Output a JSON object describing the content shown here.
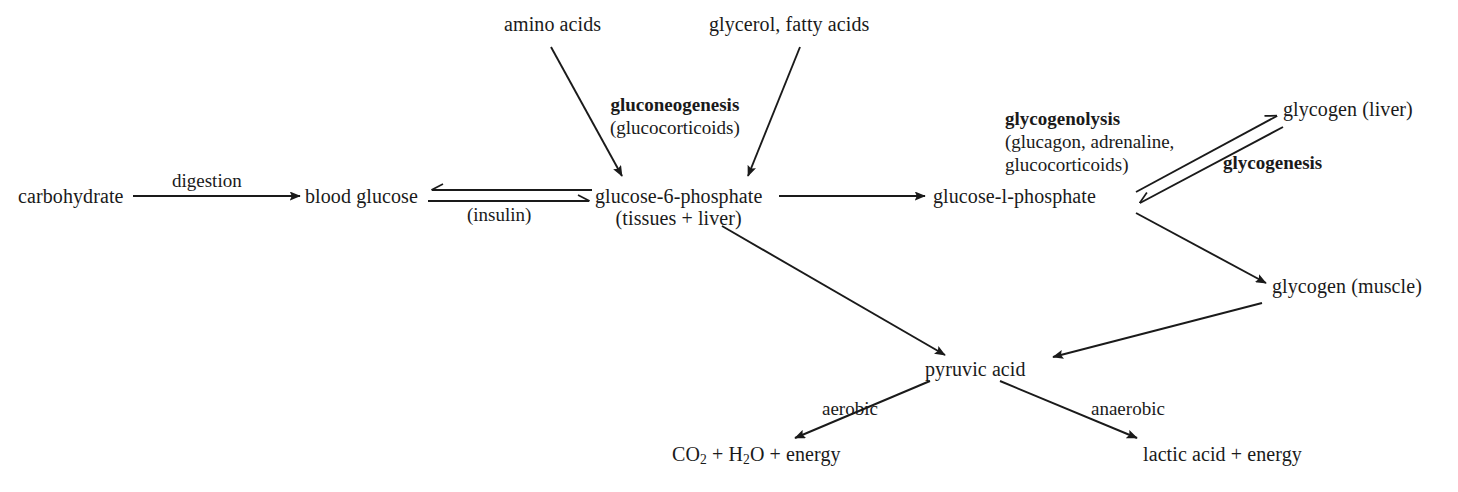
{
  "diagram": {
    "ink_color": "#1a1a1a",
    "background_color": "#ffffff"
  },
  "nodes": {
    "carbohydrate": "carbohydrate",
    "amino_acids": "amino acids",
    "glycerol_fatty_acids": "glycerol, fatty acids",
    "blood_glucose": "blood glucose",
    "g6p_main": "glucose-6-phosphate",
    "g6p_sub": "(tissues + liver)",
    "g1p": "glucose-l-phosphate",
    "glycogen_liver": "glycogen (liver)",
    "glycogen_muscle": "glycogen (muscle)",
    "pyruvic_acid": "pyruvic acid",
    "co2_h2o_energy": {
      "part1": "CO",
      "sub1": "2",
      "part2": " + H",
      "sub2": "2",
      "part3": "O + energy"
    },
    "lactic_acid_energy": "lactic acid + energy"
  },
  "edge_labels": {
    "digestion": "digestion",
    "insulin": "(insulin)",
    "aerobic": "aerobic",
    "anaerobic": "anaerobic"
  },
  "enzyme_labels": {
    "gluconeogenesis": {
      "name": "gluconeogenesis",
      "regulators": "(glucocorticoids)"
    },
    "glycogenolysis": {
      "name": "glycogenolysis",
      "regulators_line1": "(glucagon, adrenaline,",
      "regulators_line2": "glucocorticoids)"
    },
    "glycogenesis": {
      "name": "glycogenesis"
    }
  }
}
